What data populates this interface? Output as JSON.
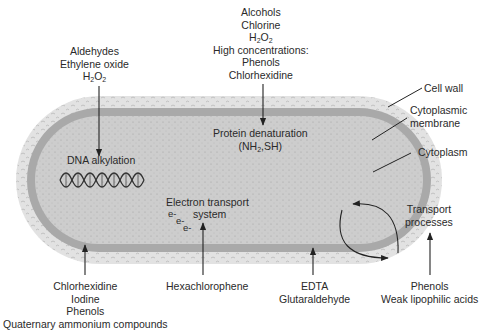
{
  "diagram": {
    "structures": {
      "cell_wall": "Cell wall",
      "cytoplasmic_membrane_1": "Cytoplasmic",
      "cytoplasmic_membrane_2": "membrane",
      "cytoplasm": "Cytoplasm"
    },
    "targets": {
      "dna_alkylation": "DNA alkylation",
      "protein_denaturation": "Protein denaturation",
      "protein_groups_pre": "(NH",
      "protein_groups_sub": "2",
      "protein_groups_post": ",SH)",
      "electron_transport_1": "Electron transport",
      "electron_transport_2": "system",
      "electrons": [
        "e-",
        "e-",
        "e-"
      ],
      "transport_1": "Transport",
      "transport_2": "processes"
    },
    "agents": {
      "aldehydes_group": [
        "Aldehydes",
        "Ethylene oxide"
      ],
      "h2o2": {
        "pre": "H",
        "sub1": "2",
        "mid": "O",
        "sub2": "2"
      },
      "protein_group": [
        "Alcohols",
        "Chlorine",
        "High concentrations:",
        "Phenols",
        "Chlorhexidine"
      ],
      "membrane_group": [
        "Chlorhexidine",
        "Iodine",
        "Phenols",
        "Quaternary ammonium compounds"
      ],
      "hexachlorophene": "Hexachlorophene",
      "wall_group": [
        "EDTA",
        "Glutaraldehyde"
      ],
      "transport_group": [
        "Phenols",
        "Weak lipophilic acids"
      ]
    },
    "colors": {
      "cell_wall": "#dcdcdc",
      "membrane": "#a9a9a9",
      "cytoplasm": "#cbcbcb",
      "line": "#222222"
    }
  }
}
